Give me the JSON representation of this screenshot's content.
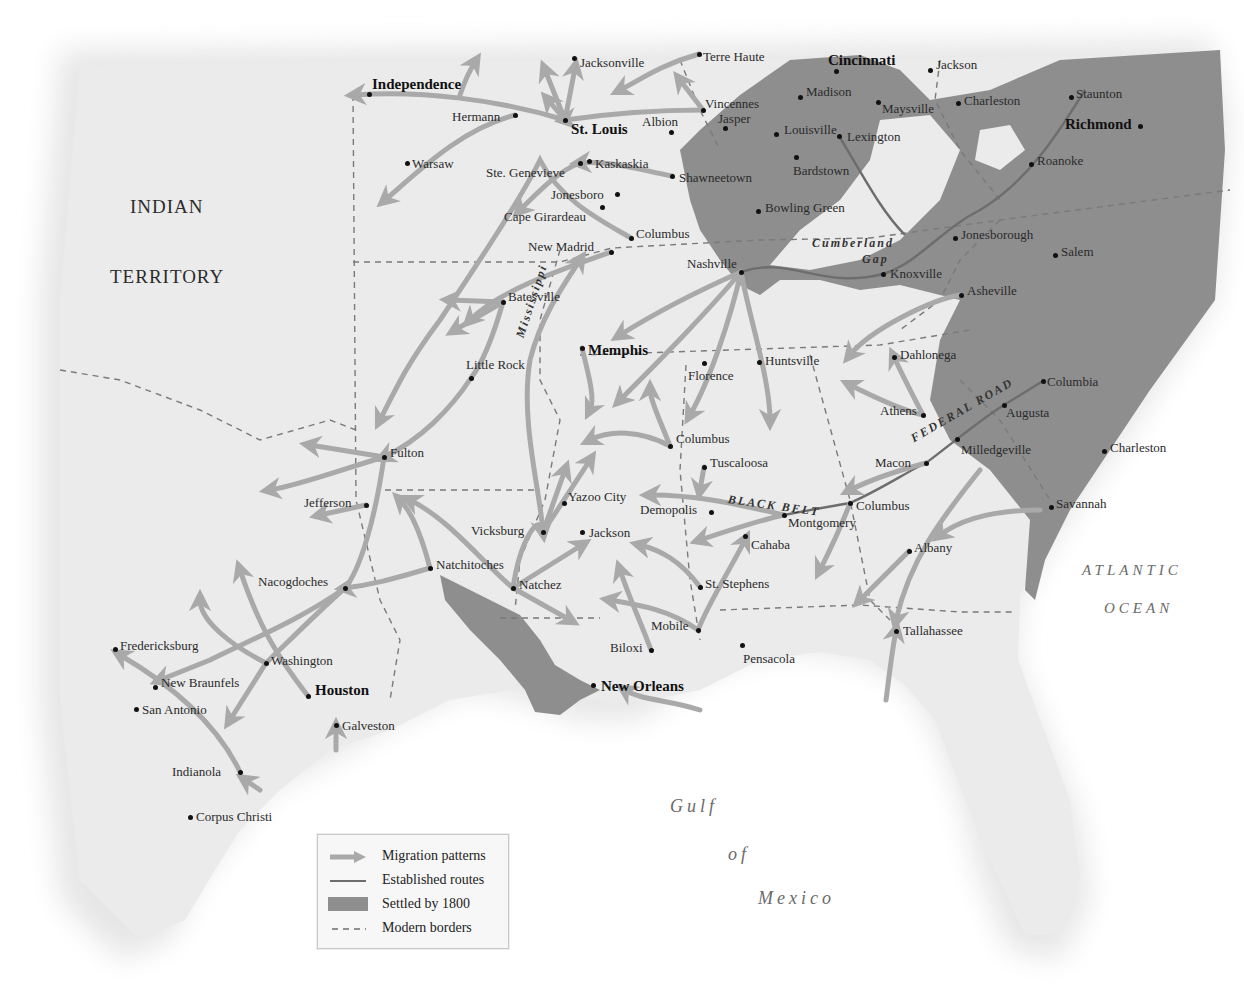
{
  "map": {
    "regions": [
      {
        "label": "INDIAN",
        "x": 130,
        "y": 196
      },
      {
        "label": "TERRITORY",
        "x": 110,
        "y": 266
      }
    ],
    "water_bodies": [
      {
        "label": "Gulf",
        "x": 670,
        "y": 796,
        "size": 18
      },
      {
        "label": "of",
        "x": 728,
        "y": 844,
        "size": 18
      },
      {
        "label": "Mexico",
        "x": 758,
        "y": 888,
        "size": 18
      },
      {
        "label": "ATLANTIC",
        "x": 1082,
        "y": 562,
        "size": 15
      },
      {
        "label": "OCEAN",
        "x": 1104,
        "y": 600,
        "size": 15
      }
    ],
    "route_labels": [
      {
        "label": "Cumberland",
        "x": 812,
        "y": 236
      },
      {
        "label": "Gap",
        "x": 862,
        "y": 252
      },
      {
        "label": "BLACK BELT",
        "x": 728,
        "y": 492,
        "rotate": 8
      },
      {
        "label": "FEDERAL ROAD",
        "x": 912,
        "y": 432,
        "rotate": -30
      },
      {
        "label": "Mississippi",
        "x": 520,
        "y": 330,
        "rotate": -72
      }
    ],
    "cities": [
      {
        "name": "Independence",
        "x": 369,
        "y": 94,
        "lx": 372,
        "ly": 77,
        "major": true
      },
      {
        "name": "Jacksonville",
        "x": 574,
        "y": 58,
        "lx": 580,
        "ly": 56
      },
      {
        "name": "Terre Haute",
        "x": 699,
        "y": 54,
        "lx": 703,
        "ly": 50
      },
      {
        "name": "Cincinnati",
        "x": 836,
        "y": 71,
        "lx": 828,
        "ly": 53,
        "major": true
      },
      {
        "name": "Jackson",
        "x": 930,
        "y": 70,
        "lx": 936,
        "ly": 58
      },
      {
        "name": "Hermann",
        "x": 515,
        "y": 115,
        "lx": 452,
        "ly": 110
      },
      {
        "name": "St. Louis",
        "x": 565,
        "y": 120,
        "lx": 571,
        "ly": 122,
        "major": true
      },
      {
        "name": "Albion",
        "x": 671,
        "y": 132,
        "lx": 642,
        "ly": 115
      },
      {
        "name": "Vincennes",
        "x": 703,
        "y": 110,
        "lx": 705,
        "ly": 97
      },
      {
        "name": "Jasper",
        "x": 725,
        "y": 128,
        "lx": 718,
        "ly": 112
      },
      {
        "name": "Madison",
        "x": 800,
        "y": 97,
        "lx": 806,
        "ly": 85
      },
      {
        "name": "Maysville",
        "x": 878,
        "y": 102,
        "lx": 882,
        "ly": 102
      },
      {
        "name": "Charleston",
        "x": 958,
        "y": 103,
        "lx": 964,
        "ly": 94
      },
      {
        "name": "Staunton",
        "x": 1071,
        "y": 97,
        "lx": 1076,
        "ly": 87
      },
      {
        "name": "Richmond",
        "x": 1140,
        "y": 126,
        "lx": 1065,
        "ly": 117,
        "major": true
      },
      {
        "name": "Louisville",
        "x": 776,
        "y": 134,
        "lx": 784,
        "ly": 123
      },
      {
        "name": "Lexington",
        "x": 839,
        "y": 136,
        "lx": 847,
        "ly": 130
      },
      {
        "name": "Roanoke",
        "x": 1031,
        "y": 164,
        "lx": 1037,
        "ly": 154
      },
      {
        "name": "Warsaw",
        "x": 407,
        "y": 163,
        "lx": 412,
        "ly": 157
      },
      {
        "name": "Ste. Genevieve",
        "x": 580,
        "y": 163,
        "lx": 486,
        "ly": 166
      },
      {
        "name": "Kaskaskia",
        "x": 589,
        "y": 161,
        "lx": 595,
        "ly": 157
      },
      {
        "name": "Shawneetown",
        "x": 672,
        "y": 176,
        "lx": 679,
        "ly": 171
      },
      {
        "name": "Bardstown",
        "x": 796,
        "y": 157,
        "lx": 793,
        "ly": 164
      },
      {
        "name": "Jonesboro",
        "x": 617,
        "y": 194,
        "lx": 551,
        "ly": 188
      },
      {
        "name": "Cape Girardeau",
        "x": 602,
        "y": 207,
        "lx": 504,
        "ly": 210
      },
      {
        "name": "Bowling Green",
        "x": 758,
        "y": 211,
        "lx": 765,
        "ly": 201
      },
      {
        "name": "Columbus",
        "x": 631,
        "y": 238,
        "lx": 636,
        "ly": 227
      },
      {
        "name": "New Madrid",
        "x": 611,
        "y": 252,
        "lx": 528,
        "ly": 240
      },
      {
        "name": "Jonesborough",
        "x": 955,
        "y": 238,
        "lx": 961,
        "ly": 228
      },
      {
        "name": "Nashville",
        "x": 741,
        "y": 272,
        "lx": 687,
        "ly": 257
      },
      {
        "name": "Knoxville",
        "x": 883,
        "y": 274,
        "lx": 890,
        "ly": 267
      },
      {
        "name": "Salem",
        "x": 1055,
        "y": 255,
        "lx": 1061,
        "ly": 245
      },
      {
        "name": "Asheville",
        "x": 961,
        "y": 295,
        "lx": 967,
        "ly": 284
      },
      {
        "name": "Batesville",
        "x": 503,
        "y": 302,
        "lx": 508,
        "ly": 290
      },
      {
        "name": "Memphis",
        "x": 582,
        "y": 348,
        "lx": 588,
        "ly": 343,
        "major": true
      },
      {
        "name": "Florence",
        "x": 704,
        "y": 363,
        "lx": 688,
        "ly": 369
      },
      {
        "name": "Huntsville",
        "x": 759,
        "y": 362,
        "lx": 765,
        "ly": 354
      },
      {
        "name": "Dahlonega",
        "x": 894,
        "y": 357,
        "lx": 900,
        "ly": 348
      },
      {
        "name": "Little Rock",
        "x": 471,
        "y": 378,
        "lx": 466,
        "ly": 358
      },
      {
        "name": "Columbia",
        "x": 1043,
        "y": 381,
        "lx": 1047,
        "ly": 375
      },
      {
        "name": "Athens",
        "x": 923,
        "y": 415,
        "lx": 880,
        "ly": 404
      },
      {
        "name": "Augusta",
        "x": 1004,
        "y": 405,
        "lx": 1006,
        "ly": 406
      },
      {
        "name": "Milledgeville",
        "x": 957,
        "y": 439,
        "lx": 961,
        "ly": 443
      },
      {
        "name": "Charleston",
        "x": 1104,
        "y": 451,
        "lx": 1110,
        "ly": 441
      },
      {
        "name": "Columbus",
        "x": 670,
        "y": 446,
        "lx": 676,
        "ly": 432
      },
      {
        "name": "Fulton",
        "x": 384,
        "y": 457,
        "lx": 390,
        "ly": 446
      },
      {
        "name": "Macon",
        "x": 926,
        "y": 463,
        "lx": 875,
        "ly": 456
      },
      {
        "name": "Tuscaloosa",
        "x": 704,
        "y": 467,
        "lx": 710,
        "ly": 456
      },
      {
        "name": "Jefferson",
        "x": 366,
        "y": 505,
        "lx": 304,
        "ly": 496
      },
      {
        "name": "Yazoo City",
        "x": 564,
        "y": 503,
        "lx": 568,
        "ly": 490
      },
      {
        "name": "Demopolis",
        "x": 711,
        "y": 512,
        "lx": 640,
        "ly": 503
      },
      {
        "name": "Montgomery",
        "x": 784,
        "y": 515,
        "lx": 788,
        "ly": 516
      },
      {
        "name": "Columbus",
        "x": 850,
        "y": 503,
        "lx": 856,
        "ly": 499
      },
      {
        "name": "Savannah",
        "x": 1051,
        "y": 507,
        "lx": 1056,
        "ly": 497
      },
      {
        "name": "Vicksburg",
        "x": 543,
        "y": 532,
        "lx": 471,
        "ly": 524
      },
      {
        "name": "Jackson",
        "x": 582,
        "y": 532,
        "lx": 589,
        "ly": 526
      },
      {
        "name": "Cahaba",
        "x": 745,
        "y": 536,
        "lx": 751,
        "ly": 538
      },
      {
        "name": "Albany",
        "x": 909,
        "y": 551,
        "lx": 914,
        "ly": 541
      },
      {
        "name": "Nacogdoches",
        "x": 345,
        "y": 588,
        "lx": 258,
        "ly": 575
      },
      {
        "name": "Natchitoches",
        "x": 430,
        "y": 568,
        "lx": 436,
        "ly": 558
      },
      {
        "name": "Natchez",
        "x": 513,
        "y": 588,
        "lx": 519,
        "ly": 578
      },
      {
        "name": "St. Stephens",
        "x": 700,
        "y": 587,
        "lx": 705,
        "ly": 577
      },
      {
        "name": "Mobile",
        "x": 698,
        "y": 630,
        "lx": 651,
        "ly": 619
      },
      {
        "name": "Tallahassee",
        "x": 896,
        "y": 631,
        "lx": 903,
        "ly": 624
      },
      {
        "name": "Fredericksburg",
        "x": 115,
        "y": 649,
        "lx": 120,
        "ly": 639
      },
      {
        "name": "Washington",
        "x": 266,
        "y": 663,
        "lx": 271,
        "ly": 654
      },
      {
        "name": "Biloxi",
        "x": 651,
        "y": 650,
        "lx": 610,
        "ly": 641
      },
      {
        "name": "Pensacola",
        "x": 742,
        "y": 645,
        "lx": 743,
        "ly": 652
      },
      {
        "name": "New Braunfels",
        "x": 155,
        "y": 687,
        "lx": 161,
        "ly": 676
      },
      {
        "name": "Houston",
        "x": 308,
        "y": 696,
        "lx": 315,
        "ly": 683,
        "major": true
      },
      {
        "name": "New Orleans",
        "x": 593,
        "y": 685,
        "lx": 601,
        "ly": 679,
        "major": true
      },
      {
        "name": "San Antonio",
        "x": 136,
        "y": 709,
        "lx": 142,
        "ly": 703
      },
      {
        "name": "Galveston",
        "x": 336,
        "y": 725,
        "lx": 342,
        "ly": 719
      },
      {
        "name": "Indianola",
        "x": 240,
        "y": 772,
        "lx": 172,
        "ly": 765
      },
      {
        "name": "Corpus Christi",
        "x": 190,
        "y": 817,
        "lx": 196,
        "ly": 810
      }
    ]
  },
  "legend": {
    "items": [
      {
        "type": "migration",
        "label": "Migration patterns"
      },
      {
        "type": "route",
        "label": "Established routes"
      },
      {
        "type": "settled",
        "label": "Settled by 1800"
      },
      {
        "type": "border",
        "label": "Modern borders"
      }
    ]
  },
  "colors": {
    "land": "#e9e9e9",
    "settled": "#8e8e8e",
    "migration": "#a9a9a9",
    "route": "#6d6d6d",
    "border": "#7a7a7a",
    "water": "#ffffff"
  }
}
